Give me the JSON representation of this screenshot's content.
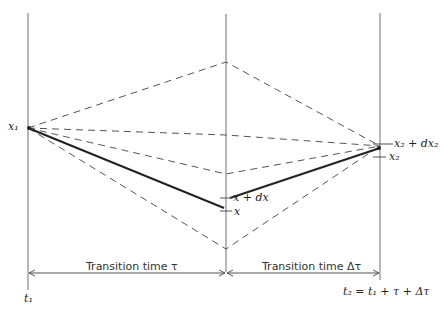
{
  "diagram": {
    "labels": {
      "x1": "x₁",
      "x2": "x₂",
      "x2_dx2": "x₂ + dx₂",
      "x_dx": "x + dx",
      "x": "x",
      "t1": "t₁",
      "t2": "t₂ = t₁ + τ + Δτ"
    },
    "intervals": {
      "first": "Transition time τ",
      "second": "Transition time Δτ"
    },
    "colors": {
      "axis": "#888888",
      "dashed": "#555555",
      "solid": "#222222"
    }
  }
}
